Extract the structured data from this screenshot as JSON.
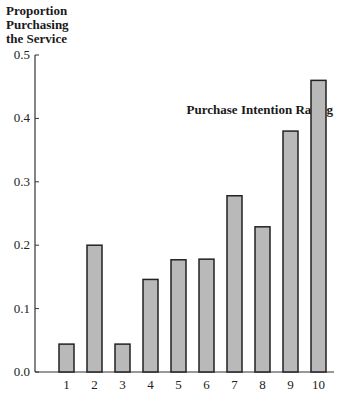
{
  "chart_data": {
    "type": "bar",
    "title": "",
    "ylabel_lines": [
      "Proportion",
      "Purchasing",
      "the Service"
    ],
    "xlabel": "Purchase Intention Rating",
    "categories": [
      "1",
      "2",
      "3",
      "4",
      "5",
      "6",
      "7",
      "8",
      "9",
      "10"
    ],
    "values": [
      0.044,
      0.2,
      0.044,
      0.146,
      0.177,
      0.178,
      0.278,
      0.229,
      0.38,
      0.46
    ],
    "ylim": [
      0.0,
      0.5
    ],
    "yticks": [
      "0.0",
      "0.1",
      "0.2",
      "0.3",
      "0.4",
      "0.5"
    ],
    "grid": false,
    "legend": null,
    "colors": {
      "bar_fill": "#b9b9b9",
      "bar_stroke": "#222222",
      "axis": "#333333"
    }
  }
}
